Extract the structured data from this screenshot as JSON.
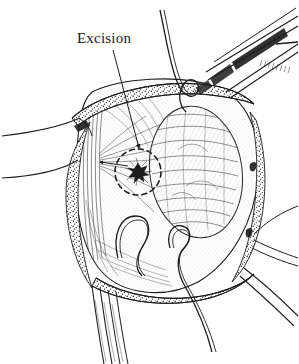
{
  "figure": {
    "domain": "medical-surgical-illustration",
    "title_visible": false,
    "style": "pen-and-ink line drawing",
    "background_color": "#ffffff",
    "ink_color": "#1c1c1c",
    "width": 299,
    "height": 364
  },
  "annotations": {
    "excision": {
      "label": "Excision",
      "label_x": 77,
      "label_y": 30,
      "leader_line": {
        "from_x": 113,
        "from_y": 50,
        "to_x": 139,
        "to_y": 148,
        "has_arrowhead": true
      },
      "target_marker": {
        "shape": "dashed-circle",
        "center_x": 138,
        "center_y": 172,
        "radius": 23,
        "dash_pattern": "5 4",
        "center_blob": true
      }
    }
  },
  "anatomy": {
    "field_outline": "open surgical field, roughly circular cavity viewed from above",
    "mass": {
      "name": "tissue-mass",
      "center_x": 196,
      "center_y": 172,
      "rx": 46,
      "ry": 66,
      "texture": "dense cross-hatched stippling"
    },
    "tissue_edges": [
      {
        "name": "superior-wound-edge",
        "texture": "stippled granular band"
      },
      {
        "name": "inferior-wound-edge",
        "texture": "stippled granular band"
      },
      {
        "name": "left-wound-edge",
        "texture": "stippled granular band"
      },
      {
        "name": "right-wound-edge",
        "texture": "stippled granular band"
      }
    ],
    "suture_loops": [
      {
        "name": "lower-left-suture-loop",
        "x": 125,
        "y": 230
      },
      {
        "name": "lower-right-suture-loop",
        "x": 176,
        "y": 232
      },
      {
        "name": "upper-suture-loop",
        "x": 183,
        "y": 92
      }
    ]
  },
  "instruments": [
    {
      "name": "upper-right-forceps",
      "orientation": "diagonal from upper-right"
    },
    {
      "name": "left-retractor-band",
      "orientation": "horizontal to left edge"
    },
    {
      "name": "lower-retractor-threads",
      "orientation": "descending to bottom edge"
    },
    {
      "name": "right-retractor-threads",
      "orientation": "descending to lower-right"
    }
  ],
  "colors": {
    "ink": "#1c1c1c",
    "hatching": "#2a2a2a",
    "paper": "#ffffff"
  }
}
